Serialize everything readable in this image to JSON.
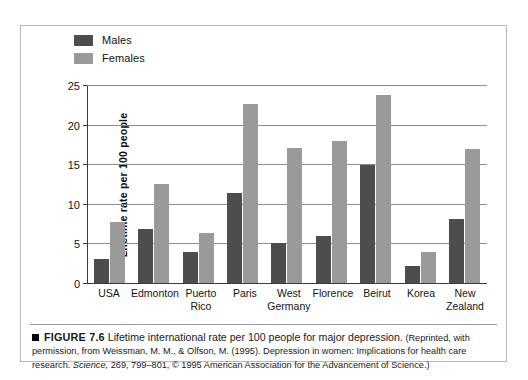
{
  "figure": {
    "bullet": "■",
    "number": "FIGURE 7.6",
    "title": "Lifetime international rate per 100 people for major depression.",
    "credit_part1": "(Reprinted, with permission, from Weissman, M. M., & Olfson, M. (1995). Depression in women: Implications for health care research. ",
    "credit_journal": "Science,",
    "credit_part2": " 269, 799–801, © 1995 American Association for the Advancement of Science.)"
  },
  "legend": {
    "items": [
      {
        "label": "Males",
        "color": "#4d4d4d"
      },
      {
        "label": "Females",
        "color": "#9a9a9a"
      }
    ]
  },
  "axis": {
    "y_title": "Lifetime rate per 100 people",
    "y_ticks": [
      "0",
      "5",
      "10",
      "15",
      "20",
      "25"
    ]
  },
  "chart_data": {
    "type": "bar",
    "title": "Lifetime international rate per 100 people for major depression.",
    "xlabel": "",
    "ylabel": "Lifetime rate per 100 people",
    "ylim": [
      0,
      25
    ],
    "yticks": [
      0,
      5,
      10,
      15,
      20,
      25
    ],
    "grid": true,
    "legend_position": "top-left",
    "categories": [
      "USA",
      "Edmonton",
      "Puerto Rico",
      "Paris",
      "West Germany",
      "Florence",
      "Beirut",
      "Korea",
      "New Zealand"
    ],
    "series": [
      {
        "name": "Males",
        "color": "#4d4d4d",
        "values": [
          3.2,
          7.0,
          4.0,
          11.5,
          5.2,
          6.1,
          15.0,
          2.3,
          8.2
        ]
      },
      {
        "name": "Females",
        "color": "#9a9a9a",
        "values": [
          7.8,
          12.6,
          6.4,
          22.7,
          17.2,
          18.1,
          23.9,
          4.1,
          17.0
        ]
      }
    ]
  },
  "x_labels": [
    {
      "line1": "USA",
      "line2": ""
    },
    {
      "line1": "Edmonton",
      "line2": ""
    },
    {
      "line1": "Puerto",
      "line2": "Rico"
    },
    {
      "line1": "Paris",
      "line2": ""
    },
    {
      "line1": "West",
      "line2": "Germany"
    },
    {
      "line1": "Florence",
      "line2": ""
    },
    {
      "line1": "Beirut",
      "line2": ""
    },
    {
      "line1": "Korea",
      "line2": ""
    },
    {
      "line1": "New",
      "line2": "Zealand"
    }
  ]
}
